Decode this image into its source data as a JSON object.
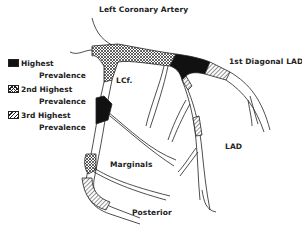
{
  "title": "Left Coronary Artery",
  "legend": {
    "items": [
      {
        "pattern": "solid",
        "line1": "Highest",
        "line2": "Prevalence"
      },
      {
        "pattern": "crosshatch",
        "line1": "2nd Highest",
        "line2": "Prevalence"
      },
      {
        "pattern": "diagonal-hatch",
        "line1": "3rd Highest",
        "line2": "Prevalence"
      }
    ]
  },
  "labels": {
    "lcf": "LCf.",
    "first_diagonal": "1st Diagonal LAD",
    "lad": "LAD",
    "marginals": "Marginals",
    "posterior": "Posterior"
  },
  "colors": {
    "ink": "#222222",
    "highest": "#111111",
    "background": "#ffffff"
  }
}
